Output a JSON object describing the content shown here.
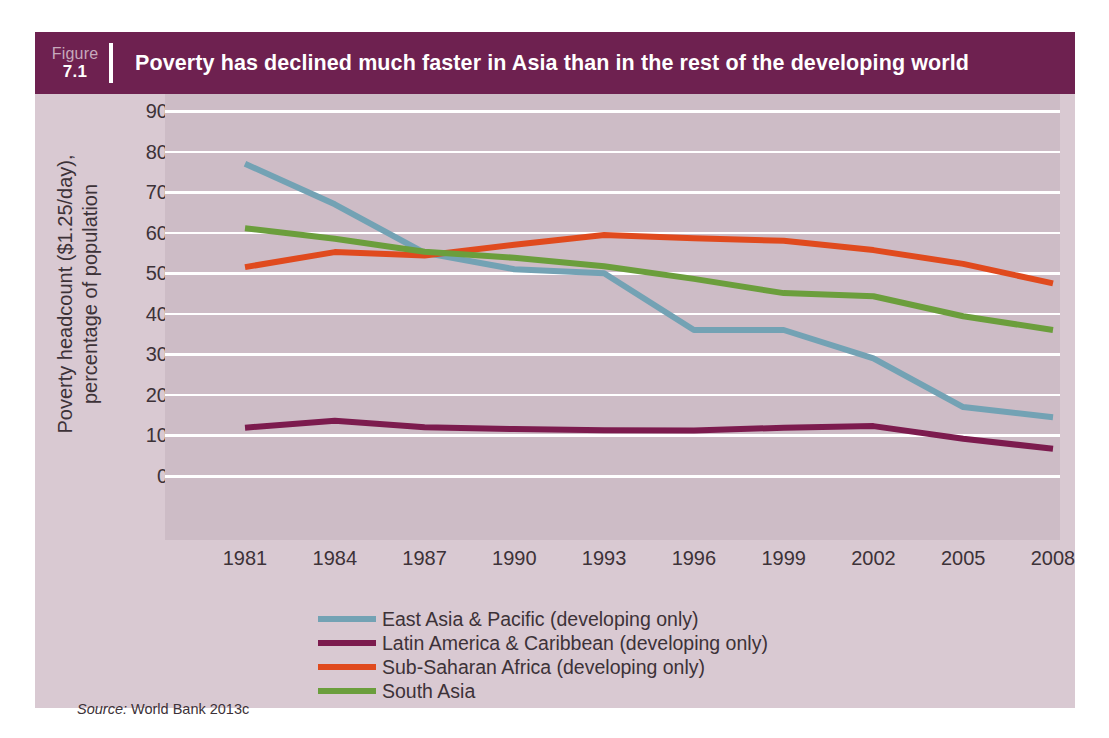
{
  "figure": {
    "label_word": "Figure",
    "number": "7.1",
    "title": "Poverty has declined much faster in Asia than in the rest of the developing world",
    "source_label": "Source:",
    "source_text": "World Bank 2013c"
  },
  "colors": {
    "title_bar": "#6e2150",
    "panel_bg": "#d9c9d2",
    "plot_bg": "#cdbcc6",
    "gridline": "#ffffff",
    "text": "#3d3238",
    "east_asia": "#73a2b4",
    "latin_america": "#7c1b4e",
    "sub_saharan": "#e04a1e",
    "south_asia": "#6b9e3c"
  },
  "chart_data": {
    "type": "line",
    "title": "Poverty has declined much faster in Asia than in the rest of the developing world",
    "xlabel": "",
    "ylabel": "Poverty headcount ($1.25/day), percentage of population",
    "x": [
      1981,
      1984,
      1987,
      1990,
      1993,
      1996,
      1999,
      2002,
      2005,
      2008
    ],
    "xtick_labels": [
      "1981",
      "1984",
      "1987",
      "1990",
      "1993",
      "1996",
      "1999",
      "2002",
      "2005",
      "2008"
    ],
    "ytick_labels": [
      "90",
      "80",
      "70",
      "60",
      "50",
      "40",
      "30",
      "20",
      "10",
      "0"
    ],
    "yticks": [
      90,
      80,
      70,
      60,
      50,
      40,
      30,
      20,
      10,
      0
    ],
    "ylim": [
      0,
      90
    ],
    "grid": true,
    "legend_position": "bottom-center",
    "series": [
      {
        "name": "East Asia & Pacific (developing only)",
        "color": "#73a2b4",
        "values": [
          77.0,
          67.0,
          55.0,
          51.0,
          50.0,
          36.0,
          36.0,
          29.0,
          17.0,
          14.5
        ]
      },
      {
        "name": "Latin America & Caribbean (developing only)",
        "color": "#7c1b4e",
        "values": [
          11.9,
          13.6,
          12.0,
          11.6,
          11.3,
          11.2,
          11.9,
          12.3,
          9.2,
          6.7
        ]
      },
      {
        "name": "Sub-Saharan Africa (developing only)",
        "color": "#e04a1e",
        "values": [
          51.5,
          55.2,
          54.4,
          57.0,
          59.4,
          58.6,
          58.0,
          55.7,
          52.3,
          47.5
        ]
      },
      {
        "name": "South Asia",
        "color": "#6b9e3c",
        "values": [
          61.1,
          58.5,
          55.3,
          53.8,
          51.7,
          48.6,
          45.1,
          44.3,
          39.4,
          36.0
        ]
      }
    ]
  },
  "y_axis": {
    "line1": "Poverty headcount ($1.25/day),",
    "line2": "percentage of population"
  }
}
